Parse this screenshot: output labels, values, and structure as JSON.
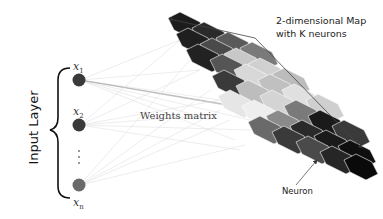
{
  "diagram": {
    "type": "self-organizing-map",
    "input_layer_label": "Input Layer",
    "inputs": [
      {
        "label": "x",
        "sub": "1",
        "color": "#3a3a3a"
      },
      {
        "label": "x",
        "sub": "2",
        "color": "#3a3a3a"
      },
      {
        "label": "x",
        "sub": "n",
        "color": "#6a6a6a"
      }
    ],
    "ellipsis": "⋮",
    "weights_label": "Weights matrix",
    "map_label_line1": "2-dimensional Map",
    "map_label_line2": "with K neurons",
    "neuron_label": "Neuron",
    "colors": {
      "dark": "#1c1c1c",
      "mid_dark": "#3e3e3e",
      "mid": "#6b6b6b",
      "light": "#b8b8b8",
      "lighter": "#d6d6d6",
      "lightest": "#e8e8e8",
      "line": "#cfcfcf",
      "arrow": "#444444"
    }
  }
}
